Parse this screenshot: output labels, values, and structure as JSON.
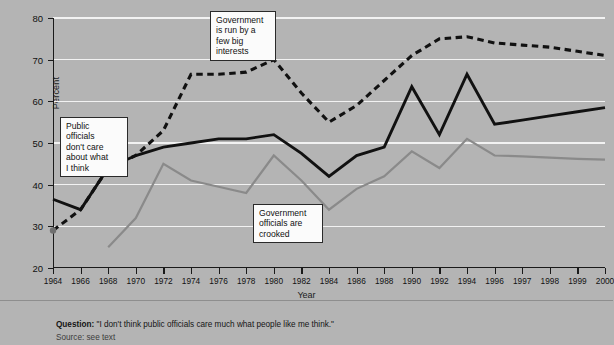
{
  "chart_data": {
    "type": "line",
    "title": "",
    "xlabel": "Year",
    "ylabel": "Percent",
    "ylim": [
      20,
      80
    ],
    "yticks": [
      20,
      30,
      40,
      50,
      60,
      70,
      80
    ],
    "grid": true,
    "legend_position": "inline-callouts",
    "categories": [
      "1964",
      "1966",
      "1968",
      "1970",
      "1972",
      "1974",
      "1976",
      "1978",
      "1980",
      "1982",
      "1984",
      "1986",
      "1988",
      "1990",
      "1992",
      "1994",
      "1996",
      "1997",
      "1998",
      "1999",
      "2000"
    ],
    "series": [
      {
        "name": "Government is run by a few big interests",
        "style": "dashed-black",
        "color": "#111111",
        "values": [
          29,
          34,
          44,
          47,
          53,
          66.5,
          66.5,
          67,
          70,
          62,
          55,
          59,
          65,
          71,
          75,
          75.5,
          74,
          73.5,
          73,
          72,
          71
        ]
      },
      {
        "name": "Public officials don't care about what I think",
        "style": "solid-black",
        "color": "#111111",
        "values": [
          36.5,
          34,
          44,
          47,
          49,
          50,
          51,
          51,
          52,
          47.5,
          42,
          47,
          49,
          63.5,
          52,
          66.5,
          54.5,
          55.5,
          56.5,
          57.5,
          58.5
        ]
      },
      {
        "name": "Government officials are crooked",
        "style": "solid-gray",
        "color": "#8a8a8a",
        "values": [
          null,
          null,
          25,
          32,
          45,
          41,
          39.5,
          38,
          47,
          41,
          34,
          39,
          42,
          48,
          44,
          51,
          47,
          46.8,
          46.5,
          46.2,
          46
        ]
      }
    ],
    "annotations": [
      {
        "id": "big-interests",
        "text_lines": [
          "Government",
          "is run by a",
          "few big",
          "interests"
        ]
      },
      {
        "id": "public-officials",
        "text_lines": [
          "Public",
          "officials",
          "don't care",
          "about what",
          " I think"
        ]
      },
      {
        "id": "crooked",
        "text_lines": [
          "Government",
          "officials are",
          "crooked"
        ]
      }
    ]
  },
  "footer": {
    "question_label": "Question:",
    "question_text": "\"I don't think public officials care much what people like me think.\"",
    "source_line": "Source: see text"
  },
  "colors": {
    "background": "#b4b4b4",
    "gridline": "#f2f2f2",
    "axis": "#1a1a1a",
    "series_black": "#111111",
    "series_gray": "#8a8a8a",
    "callout_bg": "#fbfbfb"
  }
}
